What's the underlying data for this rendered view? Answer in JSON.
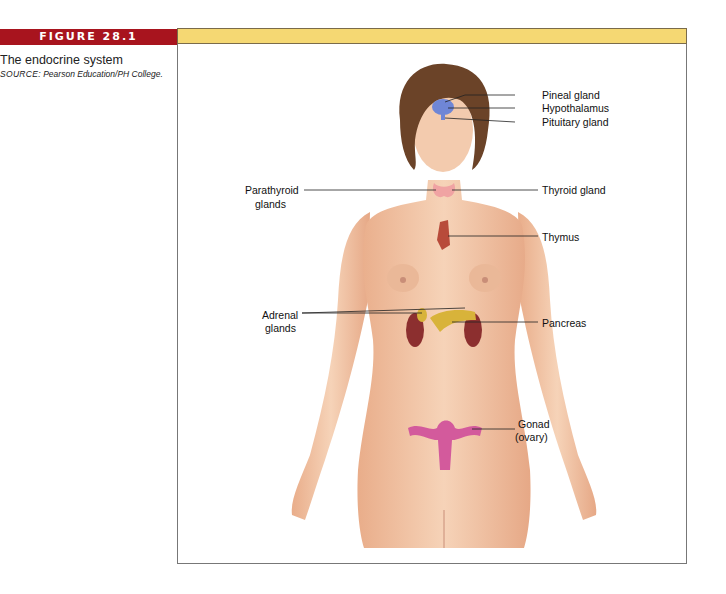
{
  "figure": {
    "number_label": "FIGURE 28.1",
    "title": "The endocrine system",
    "source_label": "SOURCE:",
    "source_text": "Pearson Education/PH College.",
    "colors": {
      "tab": "#a8141e",
      "bar": "#f5d873",
      "skin": "#f2c7a6",
      "hair": "#6b4328",
      "pineal": "#6f86d6",
      "thyroid": "#f0a3a3",
      "adrenal": "#d8b33a",
      "kidney": "#8c2f2f",
      "ovary": "#d35a9c"
    }
  },
  "labels": {
    "pineal": "Pineal gland",
    "hypothalamus": "Hypothalamus",
    "pituitary": "Pituitary gland",
    "parathyroid_1": "Parathyroid",
    "parathyroid_2": "glands",
    "thyroid": "Thyroid gland",
    "thymus": "Thymus",
    "adrenal_1": "Adrenal",
    "adrenal_2": "glands",
    "pancreas": "Pancreas",
    "gonad_1": "Gonad",
    "gonad_2": "(ovary)"
  }
}
